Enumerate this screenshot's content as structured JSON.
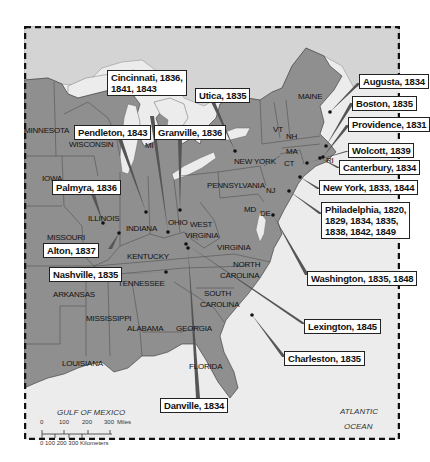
{
  "map": {
    "colors": {
      "land_us": "#8f8f8f",
      "land_other": "#d4d4d4",
      "water": "#ececec",
      "leader": "#555555",
      "border": "#222222"
    },
    "states": [
      {
        "name": "MINNESOTA",
        "x": 0,
        "y": 100
      },
      {
        "name": "WISCONSIN",
        "x": 45,
        "y": 114
      },
      {
        "name": "MI",
        "x": 121,
        "y": 115
      },
      {
        "name": "IOWA",
        "x": 18,
        "y": 148
      },
      {
        "name": "ILLINOIS",
        "x": 64,
        "y": 188
      },
      {
        "name": "MISSOURI",
        "x": 23,
        "y": 207
      },
      {
        "name": "INDIANA",
        "x": 102,
        "y": 198
      },
      {
        "name": "OHIO",
        "x": 144,
        "y": 192
      },
      {
        "name": "WEST",
        "x": 166,
        "y": 194
      },
      {
        "name": "VIRGINIA",
        "x": 161,
        "y": 205
      },
      {
        "name": "KENTUCKY",
        "x": 103,
        "y": 226
      },
      {
        "name": "VIRGINIA",
        "x": 193,
        "y": 217
      },
      {
        "name": "TENNESSEE",
        "x": 94,
        "y": 253
      },
      {
        "name": "NORTH",
        "x": 209,
        "y": 234
      },
      {
        "name": "CAROLINA",
        "x": 196,
        "y": 245
      },
      {
        "name": "ARKANSAS",
        "x": 29,
        "y": 264
      },
      {
        "name": "SOUTH",
        "x": 180,
        "y": 263
      },
      {
        "name": "CAROLINA",
        "x": 176,
        "y": 274
      },
      {
        "name": "MISSISSIPPI",
        "x": 62,
        "y": 288
      },
      {
        "name": "ALABAMA",
        "x": 103,
        "y": 298
      },
      {
        "name": "GEORGIA",
        "x": 152,
        "y": 298
      },
      {
        "name": "LOUISIANA",
        "x": 38,
        "y": 333
      },
      {
        "name": "FLORIDA",
        "x": 165,
        "y": 336
      },
      {
        "name": "PENNSYLVANIA",
        "x": 183,
        "y": 155
      },
      {
        "name": "NEW YORK",
        "x": 210,
        "y": 131
      },
      {
        "name": "VT",
        "x": 249,
        "y": 99
      },
      {
        "name": "NH",
        "x": 262,
        "y": 106
      },
      {
        "name": "MAINE",
        "x": 274,
        "y": 66
      },
      {
        "name": "MA",
        "x": 262,
        "y": 121
      },
      {
        "name": "CT",
        "x": 260,
        "y": 133
      },
      {
        "name": "RI",
        "x": 302,
        "y": 130
      },
      {
        "name": "NJ",
        "x": 242,
        "y": 160
      },
      {
        "name": "MD",
        "x": 220,
        "y": 179
      },
      {
        "name": "DE",
        "x": 236,
        "y": 183
      }
    ],
    "water_labels": [
      {
        "name": "GULF OF MEXICO",
        "x": 33,
        "y": 382
      },
      {
        "name": "ATLANTIC",
        "x": 316,
        "y": 381
      },
      {
        "name": "OCEAN",
        "x": 320,
        "y": 396
      }
    ],
    "locations": [
      {
        "label": "Cincinnati, 1836,\n1841, 1843",
        "box": {
          "x": 83,
          "y": 44
        },
        "dot": {
          "x": 144,
          "y": 206
        },
        "anchor": {
          "x": 128,
          "y": 90
        }
      },
      {
        "label": "Utica, 1835",
        "box": {
          "x": 171,
          "y": 62
        },
        "dot": {
          "x": 211,
          "y": 125
        },
        "anchor": {
          "x": 189,
          "y": 76
        }
      },
      {
        "label": "Augusta, 1834",
        "box": {
          "x": 335,
          "y": 48
        },
        "dot": {
          "x": 306,
          "y": 86
        },
        "anchor": {
          "x": 335,
          "y": 57
        }
      },
      {
        "label": "Pendleton, 1843",
        "box": {
          "x": 50,
          "y": 99
        },
        "dot": {
          "x": 122,
          "y": 186
        },
        "anchor": {
          "x": 96,
          "y": 113
        }
      },
      {
        "label": "Granville, 1836",
        "box": {
          "x": 130,
          "y": 99
        },
        "dot": {
          "x": 156,
          "y": 184
        },
        "anchor": {
          "x": 156,
          "y": 113
        }
      },
      {
        "label": "Boston, 1835",
        "box": {
          "x": 328,
          "y": 70
        },
        "dot": {
          "x": 302,
          "y": 120
        },
        "anchor": {
          "x": 328,
          "y": 77
        }
      },
      {
        "label": "Providence, 1831",
        "box": {
          "x": 324,
          "y": 91
        },
        "dot": {
          "x": 299,
          "y": 131
        },
        "anchor": {
          "x": 324,
          "y": 99
        }
      },
      {
        "label": "Wolcott, 1839",
        "box": {
          "x": 324,
          "y": 117
        },
        "dot": {
          "x": 283,
          "y": 137
        },
        "anchor": {
          "x": 324,
          "y": 125
        }
      },
      {
        "label": "Canterbury, 1834",
        "box": {
          "x": 315,
          "y": 134
        },
        "dot": {
          "x": 296,
          "y": 132
        },
        "anchor": {
          "x": 315,
          "y": 142
        }
      },
      {
        "label": "Palmyra, 1836",
        "box": {
          "x": 28,
          "y": 154
        },
        "dot": {
          "x": 79,
          "y": 197
        },
        "anchor": {
          "x": 69,
          "y": 168
        }
      },
      {
        "label": "New York, 1833, 1844",
        "box": {
          "x": 295,
          "y": 154
        },
        "dot": {
          "x": 276,
          "y": 151
        },
        "anchor": {
          "x": 295,
          "y": 163
        }
      },
      {
        "label": "Alton, 1837",
        "box": {
          "x": 19,
          "y": 217
        },
        "dot": {
          "x": 95,
          "y": 207
        },
        "anchor": {
          "x": 86,
          "y": 223
        }
      },
      {
        "label": "Philadelphia, 1820,\n1829, 1834, 1835,\n1838, 1842, 1849",
        "box": {
          "x": 297,
          "y": 176
        },
        "dot": {
          "x": 265,
          "y": 165
        },
        "anchor": {
          "x": 297,
          "y": 188
        }
      },
      {
        "label": "Nashville, 1835",
        "box": {
          "x": 25,
          "y": 241
        },
        "dot": {
          "x": 142,
          "y": 246
        },
        "anchor": {
          "x": 104,
          "y": 248
        }
      },
      {
        "label": "Washington, 1835, 1848",
        "box": {
          "x": 283,
          "y": 245
        },
        "dot": {
          "x": 249,
          "y": 189
        },
        "anchor": {
          "x": 283,
          "y": 249
        }
      },
      {
        "label": "Lexington, 1845",
        "box": {
          "x": 280,
          "y": 293
        },
        "dot": {
          "x": 162,
          "y": 218
        },
        "anchor": {
          "x": 280,
          "y": 298
        }
      },
      {
        "label": "Charleston, 1835",
        "box": {
          "x": 260,
          "y": 325
        },
        "dot": {
          "x": 228,
          "y": 289
        },
        "anchor": {
          "x": 260,
          "y": 331
        }
      },
      {
        "label": "Danville, 1834",
        "box": {
          "x": 136,
          "y": 372
        },
        "dot": {
          "x": 164,
          "y": 222
        },
        "anchor": {
          "x": 174,
          "y": 372
        }
      }
    ],
    "scale_bar": {
      "miles_label": "Miles",
      "miles_ticks": [
        "0",
        "100",
        "200",
        "300"
      ],
      "km_label": "Kilometers",
      "km_ticks": [
        "0",
        "100",
        "200",
        "300"
      ]
    }
  }
}
